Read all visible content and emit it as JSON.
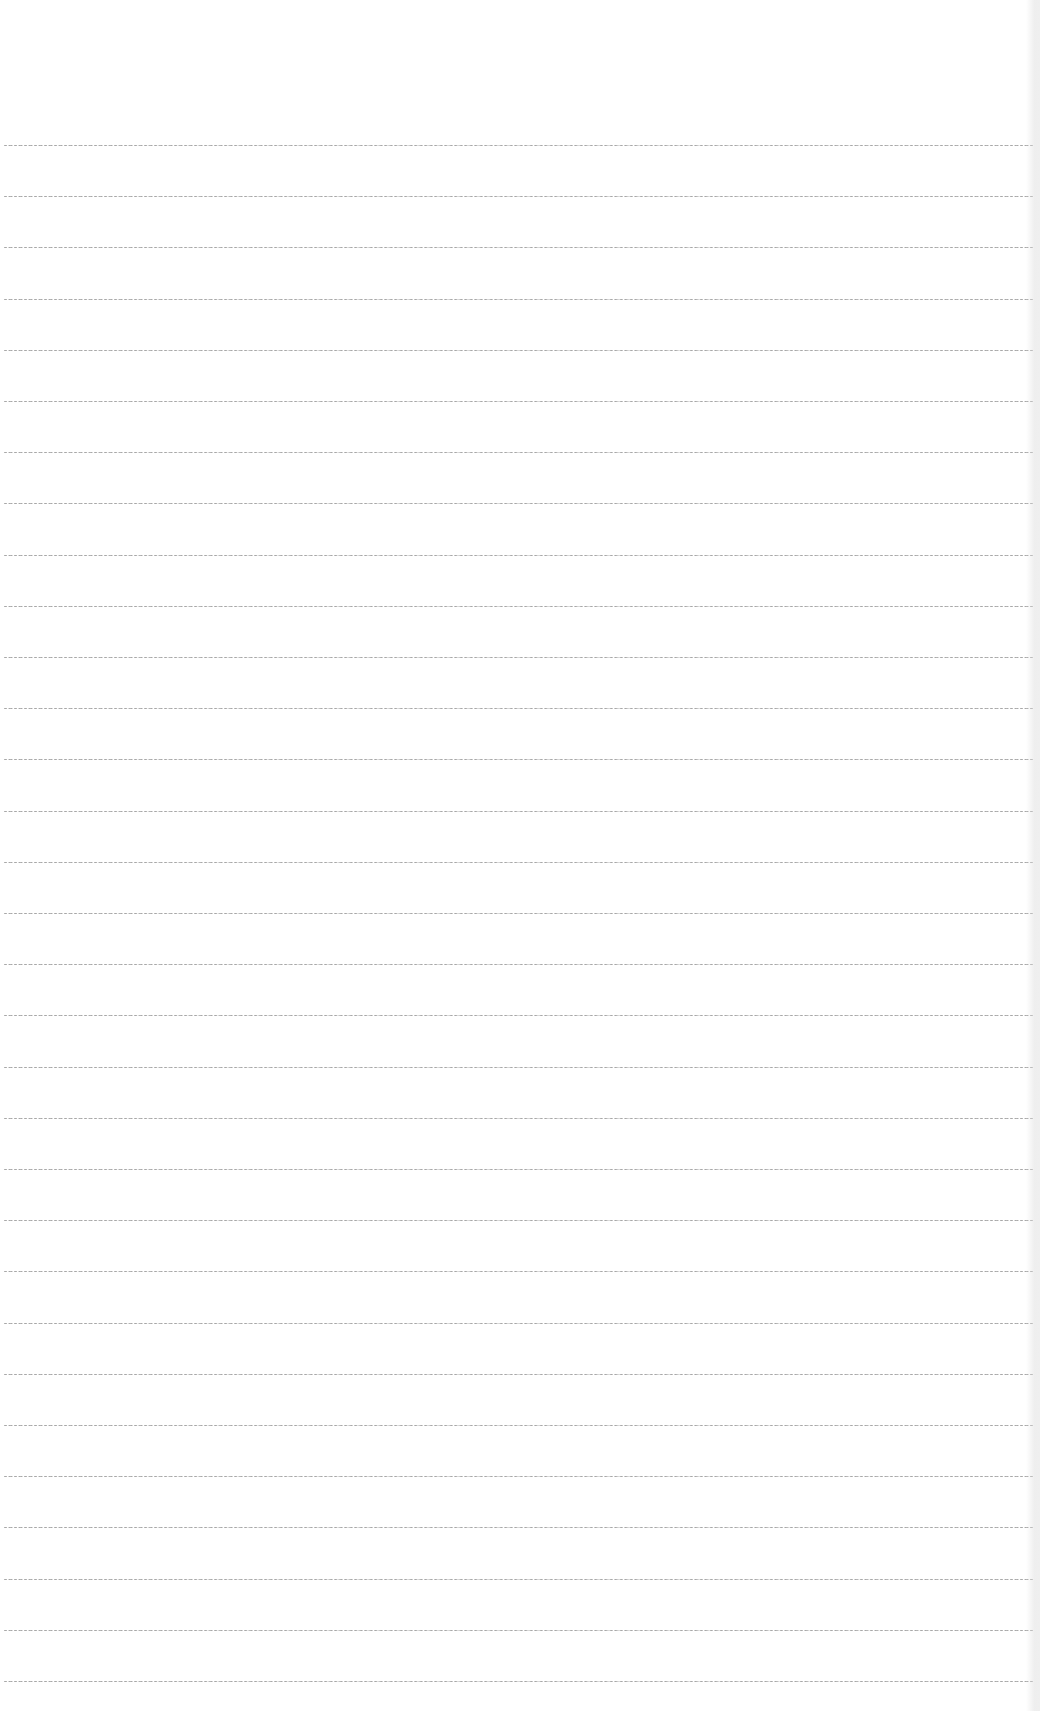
{
  "page": {
    "type": "blank-lined-paper",
    "background_color": "#ffffff",
    "rule_color": "#9a9a9a",
    "rules": {
      "count": 31,
      "first_y": 145,
      "spacing": 51.2,
      "left_x": 4,
      "right_x": 1033
    },
    "text_content": []
  }
}
